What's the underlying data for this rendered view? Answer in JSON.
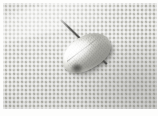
{
  "image": {
    "kind": "photograph",
    "subject_label": "pale feather-like specimen on woven cloth",
    "width_px": 158,
    "height_px": 116,
    "margin": {
      "top_px": 3,
      "left_px": 3,
      "right_px": 1,
      "bottom_px": 7,
      "color": "#fdfdfc"
    },
    "plate": {
      "width_px": 154,
      "height_px": 106,
      "background_label": "woven-fabric-mesh",
      "weave_cell_px": 3,
      "colors": {
        "cloth_base": "#c3c3be",
        "cloth_light_thread": "#dcdcd7",
        "cloth_dark_thread": "#a3a39e",
        "cloth_shadow": "#8e8e8a"
      }
    },
    "specimen": {
      "label": "feather-scale-body",
      "shape": "elongated oval / lanceolate",
      "rotation_deg": -27,
      "left_px": 58,
      "top_px": 33,
      "width_px": 52,
      "height_px": 36,
      "colors": {
        "highlight": "#ffffff",
        "midtone": "#e2e2dd",
        "shade": "#a9a9a3",
        "rachis": "#46463f"
      },
      "features": [
        "bright-white-upper-left-lobe",
        "central-rachis-ridge",
        "fine-barb-striations",
        "shaded-lower-right-flank",
        "cast-shadow-below"
      ]
    },
    "stem": {
      "label": "dark-thin-stem",
      "direction": "from specimen base toward lower-left",
      "angle_deg": 44,
      "start_px": [
        86,
        60
      ],
      "end_px": [
        40,
        104
      ],
      "color": "#48484a",
      "thickness_px": 1.6
    },
    "attachment_point": {
      "label": "dark-junction-shadow",
      "center_px": [
        74,
        65
      ],
      "color": "#30302e"
    },
    "lighting": {
      "direction": "upper-left",
      "streak_label": "diagonal-light-band-upper-left"
    }
  }
}
